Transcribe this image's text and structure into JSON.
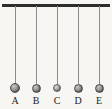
{
  "figure": {
    "background_color": "#f7f6f3",
    "width": 112,
    "height": 109
  },
  "support": {
    "name": "horizontal support bar",
    "color": "#2e2e2e",
    "x": 2,
    "y": 4,
    "width": 108,
    "height": 2.5
  },
  "pendulums": [
    {
      "label": "A",
      "string_x": 15,
      "string_top": 6,
      "string_length": 78,
      "string_color": "#8b8b8b",
      "bob_cx": 15,
      "bob_cy": 88,
      "bob_d": 10,
      "bob_color": "#8d8d8d",
      "label_x": 15,
      "label_y": 96
    },
    {
      "label": "B",
      "string_x": 36,
      "string_top": 6,
      "string_length": 78,
      "string_color": "#8b8b8b",
      "bob_cx": 36,
      "bob_cy": 88,
      "bob_d": 9,
      "bob_color": "#8d8d8d",
      "label_x": 36,
      "label_y": 96
    },
    {
      "label": "C",
      "string_x": 57,
      "string_top": 6,
      "string_length": 78,
      "string_color": "#8b8b8b",
      "bob_cx": 57,
      "bob_cy": 88,
      "bob_d": 8,
      "bob_color": "#a3a3a3",
      "label_x": 57,
      "label_y": 96
    },
    {
      "label": "D",
      "string_x": 78,
      "string_top": 6,
      "string_length": 78,
      "string_color": "#8b8b8b",
      "bob_cx": 78,
      "bob_cy": 88,
      "bob_d": 9,
      "bob_color": "#8d8d8d",
      "label_x": 78,
      "label_y": 96
    },
    {
      "label": "E",
      "string_x": 99,
      "string_top": 6,
      "string_length": 78,
      "string_color": "#8b8b8b",
      "bob_cx": 99,
      "bob_cy": 88,
      "bob_d": 9,
      "bob_color": "#8d8d8d",
      "label_x": 99,
      "label_y": 96
    }
  ]
}
